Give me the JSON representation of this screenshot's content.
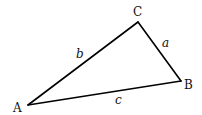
{
  "diagram": {
    "type": "triangle",
    "vertices": {
      "A": {
        "label": "A",
        "x": 28,
        "y": 105
      },
      "B": {
        "label": "B",
        "x": 181,
        "y": 81
      },
      "C": {
        "label": "C",
        "x": 138,
        "y": 22
      }
    },
    "sides": {
      "a": {
        "label": "a",
        "from": "B",
        "to": "C"
      },
      "b": {
        "label": "b",
        "from": "A",
        "to": "C"
      },
      "c": {
        "label": "c",
        "from": "A",
        "to": "B"
      }
    },
    "colors": {
      "line": "#000000",
      "text": "#111111",
      "background": "#ffffff"
    }
  }
}
